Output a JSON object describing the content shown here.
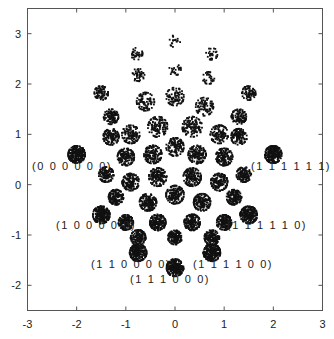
{
  "chart_data": {
    "type": "scatter",
    "title": "",
    "xlabel": "",
    "ylabel": "",
    "xlim": [
      -3,
      3
    ],
    "ylim": [
      -2.5,
      3.5
    ],
    "grid": false,
    "legend": null,
    "xticks": [
      -3,
      -2,
      -1,
      0,
      1,
      2,
      3
    ],
    "yticks": [
      -2,
      -1,
      0,
      1,
      2,
      3
    ],
    "marker_color": "#111111",
    "clusters": [
      {
        "x": -2.0,
        "y": 0.6,
        "spread": 0.17,
        "n": 260,
        "label": "(0 0 0 0 0 0)"
      },
      {
        "x": 2.0,
        "y": 0.6,
        "spread": 0.17,
        "n": 260,
        "label": "(1 1 1 1 1 1)"
      },
      {
        "x": -1.5,
        "y": -0.6,
        "spread": 0.17,
        "n": 260,
        "label": "(1 0 0 0 0 0)"
      },
      {
        "x": 1.5,
        "y": -0.6,
        "spread": 0.17,
        "n": 260,
        "label": "(1 1 1 1 1 0)"
      },
      {
        "x": -0.75,
        "y": -1.35,
        "spread": 0.17,
        "n": 260,
        "label": "(1 1 0 0 0 0)"
      },
      {
        "x": 0.75,
        "y": -1.35,
        "spread": 0.17,
        "n": 260,
        "label": "(1 1 1 1 0 0)"
      },
      {
        "x": 0.0,
        "y": -1.65,
        "spread": 0.17,
        "n": 260,
        "label": "(1 1 1 0 0 0)"
      },
      {
        "x": 0.0,
        "y": 2.85,
        "spread": 0.12,
        "n": 18,
        "label": ""
      },
      {
        "x": -0.78,
        "y": 2.6,
        "spread": 0.12,
        "n": 35,
        "label": ""
      },
      {
        "x": 0.75,
        "y": 2.6,
        "spread": 0.12,
        "n": 30,
        "label": ""
      },
      {
        "x": -0.75,
        "y": 2.18,
        "spread": 0.13,
        "n": 45,
        "label": ""
      },
      {
        "x": 0.0,
        "y": 2.28,
        "spread": 0.12,
        "n": 25,
        "label": ""
      },
      {
        "x": 0.68,
        "y": 2.12,
        "spread": 0.12,
        "n": 30,
        "label": ""
      },
      {
        "x": -1.5,
        "y": 1.82,
        "spread": 0.14,
        "n": 90,
        "label": ""
      },
      {
        "x": 1.5,
        "y": 1.82,
        "spread": 0.14,
        "n": 80,
        "label": ""
      },
      {
        "x": -1.3,
        "y": 1.35,
        "spread": 0.15,
        "n": 110,
        "label": ""
      },
      {
        "x": 1.3,
        "y": 1.35,
        "spread": 0.15,
        "n": 110,
        "label": ""
      },
      {
        "x": -0.6,
        "y": 1.65,
        "spread": 0.18,
        "n": 90,
        "label": ""
      },
      {
        "x": 0.0,
        "y": 1.75,
        "spread": 0.18,
        "n": 90,
        "label": ""
      },
      {
        "x": 0.6,
        "y": 1.55,
        "spread": 0.18,
        "n": 90,
        "label": ""
      },
      {
        "x": -1.3,
        "y": 0.95,
        "spread": 0.16,
        "n": 130,
        "label": ""
      },
      {
        "x": 1.3,
        "y": 0.95,
        "spread": 0.16,
        "n": 130,
        "label": ""
      },
      {
        "x": -0.9,
        "y": 1.0,
        "spread": 0.18,
        "n": 120,
        "label": ""
      },
      {
        "x": 0.9,
        "y": 1.0,
        "spread": 0.18,
        "n": 120,
        "label": ""
      },
      {
        "x": -0.35,
        "y": 1.15,
        "spread": 0.2,
        "n": 130,
        "label": ""
      },
      {
        "x": 0.35,
        "y": 1.15,
        "spread": 0.2,
        "n": 130,
        "label": ""
      },
      {
        "x": -1.0,
        "y": 0.55,
        "spread": 0.17,
        "n": 150,
        "label": ""
      },
      {
        "x": 1.0,
        "y": 0.55,
        "spread": 0.17,
        "n": 150,
        "label": ""
      },
      {
        "x": -0.45,
        "y": 0.6,
        "spread": 0.18,
        "n": 150,
        "label": ""
      },
      {
        "x": 0.45,
        "y": 0.6,
        "spread": 0.18,
        "n": 150,
        "label": ""
      },
      {
        "x": 0.0,
        "y": 0.75,
        "spread": 0.18,
        "n": 130,
        "label": ""
      },
      {
        "x": -1.4,
        "y": 0.2,
        "spread": 0.15,
        "n": 130,
        "label": ""
      },
      {
        "x": 1.4,
        "y": 0.2,
        "spread": 0.15,
        "n": 130,
        "label": ""
      },
      {
        "x": -0.9,
        "y": 0.05,
        "spread": 0.17,
        "n": 160,
        "label": ""
      },
      {
        "x": 0.9,
        "y": 0.05,
        "spread": 0.17,
        "n": 160,
        "label": ""
      },
      {
        "x": -0.35,
        "y": 0.15,
        "spread": 0.18,
        "n": 160,
        "label": ""
      },
      {
        "x": 0.35,
        "y": 0.15,
        "spread": 0.18,
        "n": 160,
        "label": ""
      },
      {
        "x": -1.2,
        "y": -0.25,
        "spread": 0.15,
        "n": 150,
        "label": ""
      },
      {
        "x": 1.2,
        "y": -0.25,
        "spread": 0.15,
        "n": 150,
        "label": ""
      },
      {
        "x": -0.55,
        "y": -0.35,
        "spread": 0.17,
        "n": 170,
        "label": ""
      },
      {
        "x": 0.55,
        "y": -0.35,
        "spread": 0.17,
        "n": 170,
        "label": ""
      },
      {
        "x": 0.0,
        "y": -0.2,
        "spread": 0.18,
        "n": 170,
        "label": ""
      },
      {
        "x": -1.0,
        "y": -0.75,
        "spread": 0.15,
        "n": 170,
        "label": ""
      },
      {
        "x": 1.0,
        "y": -0.75,
        "spread": 0.15,
        "n": 170,
        "label": ""
      },
      {
        "x": -0.35,
        "y": -0.75,
        "spread": 0.16,
        "n": 180,
        "label": ""
      },
      {
        "x": 0.35,
        "y": -0.75,
        "spread": 0.16,
        "n": 180,
        "label": ""
      },
      {
        "x": 0.0,
        "y": -1.05,
        "spread": 0.14,
        "n": 150,
        "label": ""
      },
      {
        "x": -0.75,
        "y": -1.05,
        "spread": 0.15,
        "n": 150,
        "label": ""
      },
      {
        "x": 0.75,
        "y": -1.05,
        "spread": 0.15,
        "n": 150,
        "label": ""
      }
    ]
  },
  "labels": [
    {
      "text": "(0 0 0 0 0 0)",
      "x": 32,
      "y": 171
    },
    {
      "text": "(1 1 1 1 1 1)",
      "x": 251,
      "y": 171
    },
    {
      "text": "(1 0 0 0 0 0)",
      "x": 56,
      "y": 230
    },
    {
      "text": "(1 1 1 1 1 0)",
      "x": 227,
      "y": 230
    },
    {
      "text": "(1 1 0 0 0 0)",
      "x": 91,
      "y": 269
    },
    {
      "text": "(1 1 1 1 0 0)",
      "x": 193,
      "y": 269
    },
    {
      "text": "(1 1 1 0 0 0)",
      "x": 130,
      "y": 284
    }
  ]
}
